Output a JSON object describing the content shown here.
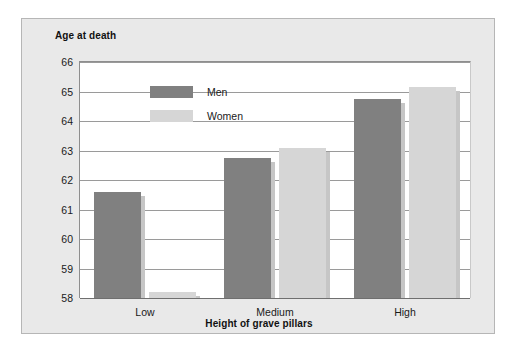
{
  "chart_data": {
    "type": "bar",
    "title": "",
    "xlabel": "Height of grave pillars",
    "ylabel": "Age at death",
    "categories": [
      "Low",
      "Medium",
      "High"
    ],
    "series": [
      {
        "name": "Men",
        "values": [
          61.6,
          62.75,
          64.75
        ],
        "color": "#808080"
      },
      {
        "name": "Women",
        "values": [
          58.2,
          63.1,
          65.15
        ],
        "color": "#d6d6d6"
      }
    ],
    "ylim": [
      58,
      66
    ],
    "yticks": [
      58,
      59,
      60,
      61,
      62,
      63,
      64,
      65,
      66
    ],
    "ytick_labels": [
      "58",
      "59",
      "60",
      "61",
      "62",
      "63",
      "64",
      "65",
      "66"
    ],
    "grid": true,
    "legend_position": "top-left-inside"
  },
  "legend": {
    "entries": [
      {
        "label": "Men"
      },
      {
        "label": "Women"
      }
    ]
  },
  "colors": {
    "men": "#808080",
    "women": "#d6d6d6",
    "panel_background": "#e9e9e9",
    "plot_background": "#ffffff",
    "gridline": "#9a9a9a",
    "panel_border": "#b6b6b6",
    "text": "#1a1a1a"
  }
}
